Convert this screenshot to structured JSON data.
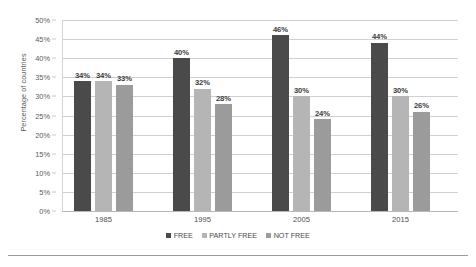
{
  "chart_data": {
    "type": "bar",
    "title": "",
    "xlabel": "",
    "ylabel": "Percentage of countries",
    "categories": [
      "1985",
      "1995",
      "2005",
      "2015"
    ],
    "series": [
      {
        "name": "FREE",
        "color": "#4a4a4a",
        "values": [
          34,
          40,
          46,
          44
        ],
        "labels": [
          "34%",
          "40%",
          "46%",
          "44%"
        ]
      },
      {
        "name": "PARTLY FREE",
        "color": "#b5b5b5",
        "values": [
          34,
          32,
          30,
          30
        ],
        "labels": [
          "34%",
          "32%",
          "30%",
          "30%"
        ]
      },
      {
        "name": "NOT FREE",
        "color": "#9b9b9b",
        "values": [
          33,
          28,
          24,
          26
        ],
        "labels": [
          "33%",
          "28%",
          "24%",
          "26%"
        ]
      }
    ],
    "ylim": [
      0,
      50
    ],
    "ytick_values": [
      50,
      45,
      40,
      35,
      30,
      25,
      20,
      15,
      10,
      5,
      0
    ],
    "ytick_labels": [
      "50%",
      "45%",
      "40%",
      "35%",
      "30%",
      "25%",
      "20%",
      "15%",
      "10%",
      "5%",
      "0%"
    ],
    "grid": true,
    "legend_position": "bottom",
    "legend_entries": [
      "FREE",
      "PARTLY FREE",
      "NOT FREE"
    ]
  }
}
